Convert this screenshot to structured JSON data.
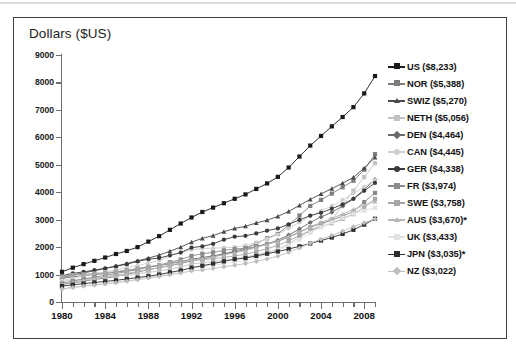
{
  "chart_data": {
    "type": "line",
    "title": "Dollars ($US)",
    "xlabel": "",
    "ylabel": "Dollars ($US)",
    "xlim": [
      1980,
      2009
    ],
    "ylim": [
      0,
      9000
    ],
    "ytick_step": 1000,
    "yticks": [
      0,
      1000,
      2000,
      3000,
      4000,
      5000,
      6000,
      7000,
      8000,
      9000
    ],
    "xticks_major": [
      1980,
      1984,
      1988,
      1992,
      1996,
      2000,
      2004,
      2008
    ],
    "xtick_step": 1,
    "grid": false,
    "legend_position": "right",
    "x": [
      1980,
      1981,
      1982,
      1983,
      1984,
      1985,
      1986,
      1987,
      1988,
      1989,
      1990,
      1991,
      1992,
      1993,
      1994,
      1995,
      1996,
      1997,
      1998,
      1999,
      2000,
      2001,
      2002,
      2003,
      2004,
      2005,
      2006,
      2007,
      2008,
      2009
    ],
    "series": [
      {
        "name": "US",
        "label": "US ($8,233)",
        "final_value": 8233,
        "color": "#1a1a1a",
        "marker": "square",
        "values": [
          1100,
          1250,
          1380,
          1500,
          1620,
          1750,
          1860,
          2000,
          2200,
          2400,
          2630,
          2860,
          3080,
          3280,
          3440,
          3600,
          3760,
          3920,
          4120,
          4320,
          4560,
          4900,
          5300,
          5700,
          6050,
          6400,
          6740,
          7100,
          7600,
          8233
        ]
      },
      {
        "name": "NOR",
        "label": "NOR ($5,388)",
        "final_value": 5388,
        "color": "#7d7d7d",
        "marker": "square",
        "values": [
          650,
          700,
          760,
          820,
          870,
          930,
          1010,
          1090,
          1180,
          1250,
          1320,
          1400,
          1500,
          1570,
          1640,
          1750,
          1860,
          1960,
          2130,
          2320,
          2480,
          2800,
          3150,
          3500,
          3720,
          3950,
          4180,
          4420,
          4820,
          5388
        ]
      },
      {
        "name": "SWIZ",
        "label": "SWIZ ($5,270)",
        "final_value": 5270,
        "color": "#4a4a4a",
        "marker": "triangle",
        "values": [
          900,
          980,
          1060,
          1140,
          1220,
          1310,
          1400,
          1500,
          1600,
          1710,
          1850,
          2000,
          2180,
          2320,
          2420,
          2560,
          2680,
          2760,
          2880,
          2980,
          3120,
          3300,
          3520,
          3740,
          3940,
          4130,
          4330,
          4540,
          4880,
          5270
        ]
      },
      {
        "name": "NETH",
        "label": "NETH ($5,056)",
        "final_value": 5056,
        "color": "#c2c2c2",
        "marker": "square",
        "values": [
          740,
          800,
          840,
          880,
          910,
          950,
          990,
          1030,
          1080,
          1130,
          1200,
          1280,
          1380,
          1430,
          1470,
          1520,
          1570,
          1630,
          1720,
          1810,
          1920,
          2120,
          2360,
          2600,
          2810,
          3000,
          3520,
          4060,
          4550,
          5056
        ]
      },
      {
        "name": "DEN",
        "label": "DEN ($4,464)",
        "final_value": 4464,
        "color": "#6a6a6a",
        "marker": "diamond",
        "values": [
          860,
          920,
          960,
          1000,
          1040,
          1090,
          1140,
          1210,
          1280,
          1330,
          1400,
          1470,
          1560,
          1620,
          1680,
          1750,
          1820,
          1900,
          2010,
          2120,
          2250,
          2440,
          2660,
          2900,
          3100,
          3270,
          3500,
          3760,
          4100,
          4464
        ]
      },
      {
        "name": "CAN",
        "label": "CAN ($4,445)",
        "final_value": 4445,
        "color": "#cfcfcf",
        "marker": "circle",
        "values": [
          780,
          860,
          960,
          1030,
          1090,
          1170,
          1250,
          1320,
          1420,
          1510,
          1680,
          1800,
          1900,
          1950,
          1960,
          1980,
          2000,
          2060,
          2170,
          2300,
          2460,
          2680,
          2900,
          3120,
          3320,
          3500,
          3720,
          3960,
          4200,
          4445
        ]
      },
      {
        "name": "GER",
        "label": "GER ($4,338)",
        "final_value": 4338,
        "color": "#3a3a3a",
        "marker": "circle",
        "values": [
          960,
          1040,
          1100,
          1160,
          1230,
          1300,
          1380,
          1480,
          1560,
          1600,
          1700,
          1800,
          1980,
          2030,
          2120,
          2270,
          2380,
          2410,
          2500,
          2600,
          2680,
          2830,
          2990,
          3150,
          3250,
          3400,
          3560,
          3760,
          4050,
          4338
        ]
      },
      {
        "name": "FR",
        "label": "FR ($3,974)",
        "final_value": 3974,
        "color": "#8a8a8a",
        "marker": "square",
        "values": [
          680,
          760,
          840,
          910,
          970,
          1040,
          1110,
          1180,
          1260,
          1340,
          1450,
          1550,
          1680,
          1760,
          1810,
          1880,
          1930,
          1960,
          2020,
          2110,
          2210,
          2360,
          2540,
          2720,
          2860,
          2990,
          3130,
          3300,
          3640,
          3974
        ]
      },
      {
        "name": "SWE",
        "label": "SWE ($3,758)",
        "final_value": 3758,
        "color": "#a6a6a6",
        "marker": "square",
        "values": [
          920,
          980,
          1010,
          1040,
          1060,
          1110,
          1160,
          1220,
          1290,
          1340,
          1420,
          1480,
          1520,
          1540,
          1580,
          1620,
          1680,
          1740,
          1840,
          1940,
          2060,
          2230,
          2420,
          2600,
          2740,
          2870,
          3030,
          3200,
          3450,
          3758
        ]
      },
      {
        "name": "AUS",
        "label": "AUS ($3,670)*",
        "final_value": 3670,
        "color": "#b5b5b5",
        "marker": "triangle",
        "values": [
          660,
          720,
          790,
          860,
          920,
          980,
          1040,
          1110,
          1180,
          1250,
          1340,
          1420,
          1520,
          1580,
          1650,
          1720,
          1800,
          1880,
          1990,
          2100,
          2230,
          2390,
          2560,
          2740,
          2900,
          3050,
          3200,
          3370,
          3520,
          3670
        ]
      },
      {
        "name": "UK",
        "label": "UK ($3,433)",
        "final_value": 3433,
        "color": "#e2e2e2",
        "marker": "square",
        "values": [
          470,
          530,
          580,
          630,
          670,
          720,
          770,
          830,
          900,
          970,
          1040,
          1130,
          1230,
          1290,
          1340,
          1400,
          1460,
          1510,
          1600,
          1740,
          1880,
          2060,
          2270,
          2520,
          2720,
          2900,
          3060,
          3220,
          3320,
          3433
        ]
      },
      {
        "name": "JPN",
        "label": "JPN ($3,035)*",
        "final_value": 3035,
        "color": "#2e2e2e",
        "marker": "square",
        "values": [
          580,
          630,
          670,
          710,
          750,
          790,
          840,
          890,
          940,
          1000,
          1080,
          1150,
          1250,
          1320,
          1400,
          1480,
          1560,
          1600,
          1680,
          1760,
          1840,
          1930,
          2030,
          2130,
          2240,
          2350,
          2480,
          2630,
          2820,
          3035
        ]
      },
      {
        "name": "NZ",
        "label": "NZ ($3,022)",
        "final_value": 3022,
        "color": "#bdbdbd",
        "marker": "diamond",
        "values": [
          480,
          530,
          580,
          620,
          660,
          700,
          760,
          810,
          870,
          930,
          990,
          1060,
          1130,
          1170,
          1220,
          1280,
          1340,
          1400,
          1480,
          1570,
          1670,
          1810,
          1970,
          2140,
          2290,
          2430,
          2580,
          2740,
          2890,
          3022
        ]
      }
    ]
  }
}
